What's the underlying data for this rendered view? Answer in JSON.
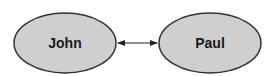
{
  "diagram": {
    "nodes": [
      {
        "id": "john",
        "label": "John",
        "fill": "#cfcfcf",
        "stroke": "#333333"
      },
      {
        "id": "paul",
        "label": "Paul",
        "fill": "#cfcfcf",
        "stroke": "#333333"
      }
    ],
    "edges": [
      {
        "from": "john",
        "to": "paul",
        "direction": "bidirectional"
      }
    ]
  }
}
